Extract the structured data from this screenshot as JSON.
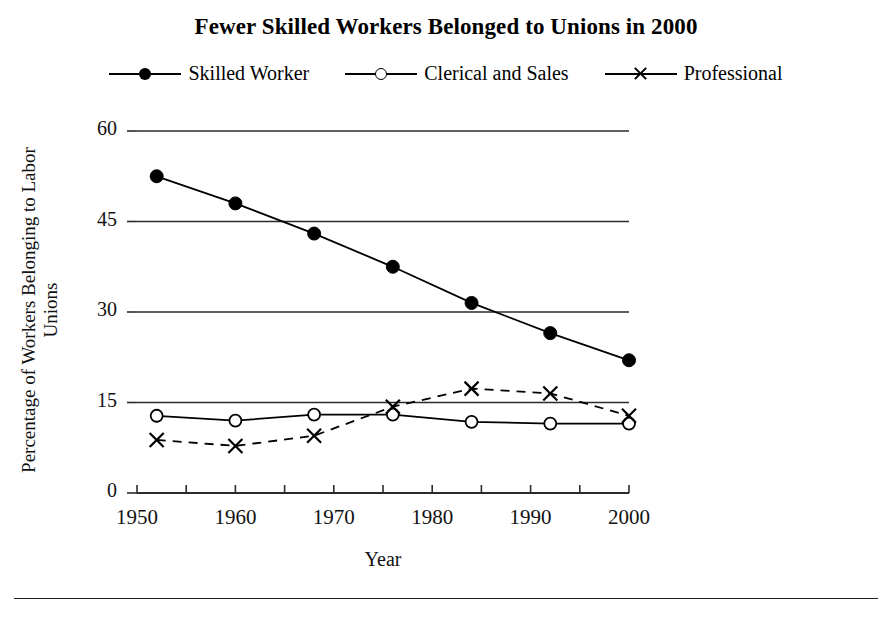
{
  "chart_data": {
    "type": "line",
    "title": "Fewer Skilled Workers Belonged to Unions in 2000",
    "xlabel": "Year",
    "ylabel": "Percentage of Workers Belonging to Labor Unions",
    "xlim": [
      1950,
      2000
    ],
    "ylim": [
      0,
      60
    ],
    "yticks": [
      0,
      15,
      30,
      45,
      60
    ],
    "ytick_labels": [
      "0",
      "15",
      "30",
      "45",
      "60"
    ],
    "xticks": [
      1950,
      1960,
      1970,
      1980,
      1990,
      2000
    ],
    "xtick_labels": [
      "1950",
      "1960",
      "1970",
      "1980",
      "1990",
      "2000"
    ],
    "xminor_ticks": [
      1950,
      1955,
      1960,
      1965,
      1970,
      1975,
      1980,
      1985,
      1990,
      1995,
      2000
    ],
    "grid": "horizontal",
    "legend_position": "top",
    "x": [
      1952,
      1960,
      1968,
      1976,
      1984,
      1992,
      2000
    ],
    "series": [
      {
        "name": "Skilled Worker",
        "marker": "filled-circle",
        "line": "solid",
        "color": "#000000",
        "values": [
          52.5,
          48.0,
          43.0,
          37.5,
          31.5,
          26.5,
          22.0
        ]
      },
      {
        "name": "Clerical and Sales",
        "marker": "open-circle",
        "line": "solid",
        "color": "#000000",
        "values": [
          12.8,
          12.0,
          13.0,
          13.0,
          11.8,
          11.5,
          11.5
        ]
      },
      {
        "name": "Professional",
        "marker": "cross",
        "line": "dashed",
        "color": "#000000",
        "values": [
          8.8,
          7.8,
          9.5,
          14.3,
          17.3,
          16.5,
          12.8
        ]
      }
    ]
  },
  "legend": {
    "items": [
      {
        "label": "Skilled Worker"
      },
      {
        "label": "Clerical and Sales"
      },
      {
        "label": "Professional"
      }
    ]
  }
}
